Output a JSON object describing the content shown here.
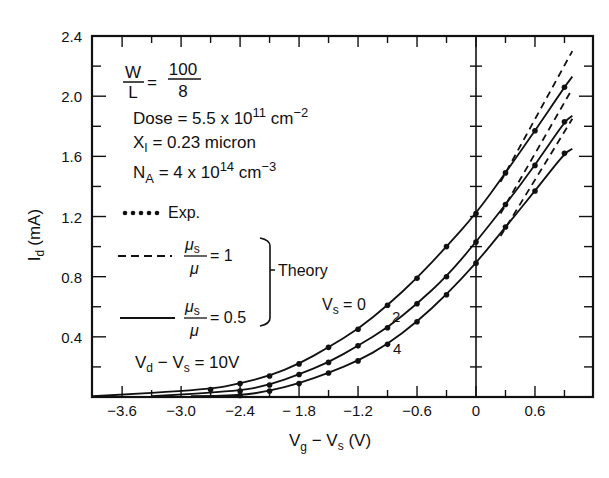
{
  "chart_data": {
    "type": "line",
    "title": "",
    "xlabel": "Vg − Vs (V)",
    "ylabel": "Id (mA)",
    "xlim": [
      -3.9,
      1.2
    ],
    "ylim": [
      0,
      2.4
    ],
    "grid": false,
    "x_ticks": [
      "-3.6",
      "-3.0",
      "-2.4",
      "- 1.8",
      "-1.2",
      "-0.6",
      "0",
      "0.6"
    ],
    "y_ticks": [
      "0.4",
      "0.8",
      "1.2",
      "1.6",
      "2.0",
      "2.4"
    ],
    "annotations": {
      "wl_label": "W/L = 100/8",
      "dose": "Dose = 5.5 x 10^11 cm^-2",
      "xi": "XI = 0.23 micron",
      "na": "NA = 4 x 10^14 cm^-3",
      "vd": "Vd − Vs = 10V",
      "vs_labels": [
        "Vs = 0",
        "2",
        "4"
      ]
    },
    "legend": [
      {
        "style": "dots",
        "label": "Exp."
      },
      {
        "style": "dashed",
        "label": "μs/μ = 1",
        "group": "Theory"
      },
      {
        "style": "solid",
        "label": "μs/μ = 0.5",
        "group": "Theory"
      }
    ],
    "series": [
      {
        "name": "Vs = 0",
        "x": [
          -2.7,
          -2.4,
          -2.1,
          -1.8,
          -1.5,
          -1.2,
          -0.9,
          -0.6,
          -0.3,
          0.0,
          0.3,
          0.6,
          0.9
        ],
        "exp": [
          0.05,
          0.09,
          0.14,
          0.22,
          0.33,
          0.45,
          0.61,
          0.79,
          1.0,
          1.22,
          1.49,
          1.77,
          2.06
        ],
        "theory_solid_end": 2.13,
        "theory_dashed_end": 2.3
      },
      {
        "name": "Vs = 2",
        "x": [
          -2.4,
          -2.1,
          -1.8,
          -1.5,
          -1.2,
          -0.9,
          -0.6,
          -0.3,
          0.0,
          0.3,
          0.6,
          0.9
        ],
        "exp": [
          0.04,
          0.08,
          0.15,
          0.23,
          0.34,
          0.46,
          0.62,
          0.8,
          1.03,
          1.28,
          1.54,
          1.83
        ],
        "theory_solid_end": 1.87,
        "theory_dashed_end": 2.05
      },
      {
        "name": "Vs = 4",
        "x": [
          -2.4,
          -2.1,
          -1.8,
          -1.5,
          -1.2,
          -0.9,
          -0.6,
          -0.3,
          0.0,
          0.3,
          0.6,
          0.9
        ],
        "exp": [
          0.01,
          0.04,
          0.09,
          0.16,
          0.24,
          0.35,
          0.5,
          0.68,
          0.89,
          1.13,
          1.37,
          1.62
        ],
        "theory_solid_end": 1.65,
        "theory_dashed_end": 1.85
      }
    ]
  },
  "labels": {
    "y_axis": "(mA)",
    "y_axis_sym": "I",
    "y_axis_sub": "d",
    "x_axis_a": "V",
    "x_axis_a_sub": "g",
    "x_axis_mid": " − V",
    "x_axis_b_sub": "s",
    "x_axis_end": " (V)",
    "wl_num_w": "W",
    "wl_den_l": "L",
    "wl_eq": "=",
    "wl_num": "100",
    "wl_den": "8",
    "dose_text": "Dose = 5.5 x 10",
    "dose_exp": "11",
    "dose_unit": " cm",
    "dose_unit_exp": "−2",
    "xi_text": "X",
    "xi_sub": "I",
    "xi_rest": " = 0.23 micron",
    "na_text": "N",
    "na_sub": "A",
    "na_rest": " = 4 x 10",
    "na_exp": "14",
    "na_unit": " cm",
    "na_unit_exp": "−3",
    "exp_label": "Exp.",
    "mu_s": "μ",
    "mu_s_sub": "s",
    "mu": "μ",
    "eq1": "= 1",
    "eq05": "= 0.5",
    "theory": "Theory",
    "vd_v": "V",
    "vd_sub": "d",
    "vd_mid": " − V",
    "vd_sub2": "s",
    "vd_end": " = 10V",
    "vs_v": "V",
    "vs_sub": "s",
    "vs_eq": " = 0",
    "vs2": "2",
    "vs4": "4"
  }
}
